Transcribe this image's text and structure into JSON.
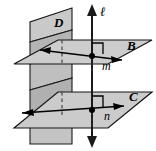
{
  "figure": {
    "background_color": "#ffffff",
    "stroke_color": "#000000",
    "plane_fill_light": "#d0d0d0",
    "plane_fill_mid": "#bdbdbd",
    "plane_fill_dark": "#a8a8a8",
    "labels": {
      "plane_d": "D",
      "plane_b": "B",
      "plane_c": "C",
      "line_ell": "ℓ",
      "line_m": "m",
      "line_n": "n"
    },
    "elements": {
      "vertical_plane_name": "plane-d",
      "upper_horizontal_plane_name": "plane-b",
      "lower_horizontal_plane_name": "plane-c",
      "vertical_line_name": "line-ell",
      "upper_line_name": "line-m",
      "lower_line_name": "line-n",
      "upper_right_angle_name": "right-angle-marker-upper",
      "lower_right_angle_name": "right-angle-marker-lower",
      "upper_point_name": "intersection-point-upper",
      "lower_point_name": "intersection-point-lower"
    }
  }
}
